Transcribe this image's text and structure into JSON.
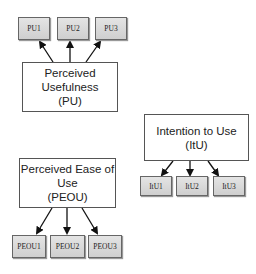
{
  "constructs": {
    "pu": {
      "line1": "Perceived",
      "line2": "Usefulness",
      "line3": "(PU)"
    },
    "peou": {
      "line1": "Perceived Ease of",
      "line2": "Use",
      "line3": "(PEOU)"
    },
    "itu": {
      "line1": "Intention to Use",
      "line2": "(ItU)"
    }
  },
  "items": {
    "pu": [
      "PU1",
      "PU2",
      "PU3"
    ],
    "peou": [
      "PEOU1",
      "PEOU2",
      "PEOU3"
    ],
    "itu": [
      "ItU1",
      "ItU2",
      "ItU3"
    ]
  },
  "colors": {
    "item_fill": "#d8d8d8",
    "border": "#555555",
    "arrow": "#111111"
  }
}
